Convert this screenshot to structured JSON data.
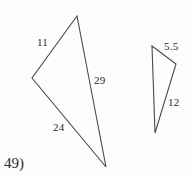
{
  "figure": {
    "problem_number": "49)",
    "background_color": "#fdfdfd",
    "stroke_color": "#4a4a4a",
    "text_color": "#2b2b2b",
    "width": 189,
    "height": 178
  },
  "large_triangle": {
    "name": "large-triangle",
    "vertices": {
      "apex": [
        77,
        16
      ],
      "left": [
        32,
        78
      ],
      "bottom": [
        106,
        167
      ]
    },
    "labels": {
      "upper_left_side": "11",
      "right_side": "29",
      "lower_left_side": "24"
    }
  },
  "small_triangle": {
    "name": "small-triangle",
    "vertices": {
      "top_left": [
        152,
        46
      ],
      "right": [
        176,
        64
      ],
      "bottom": [
        155,
        133
      ]
    },
    "labels": {
      "top_side": "5.5",
      "right_side": "12"
    }
  }
}
